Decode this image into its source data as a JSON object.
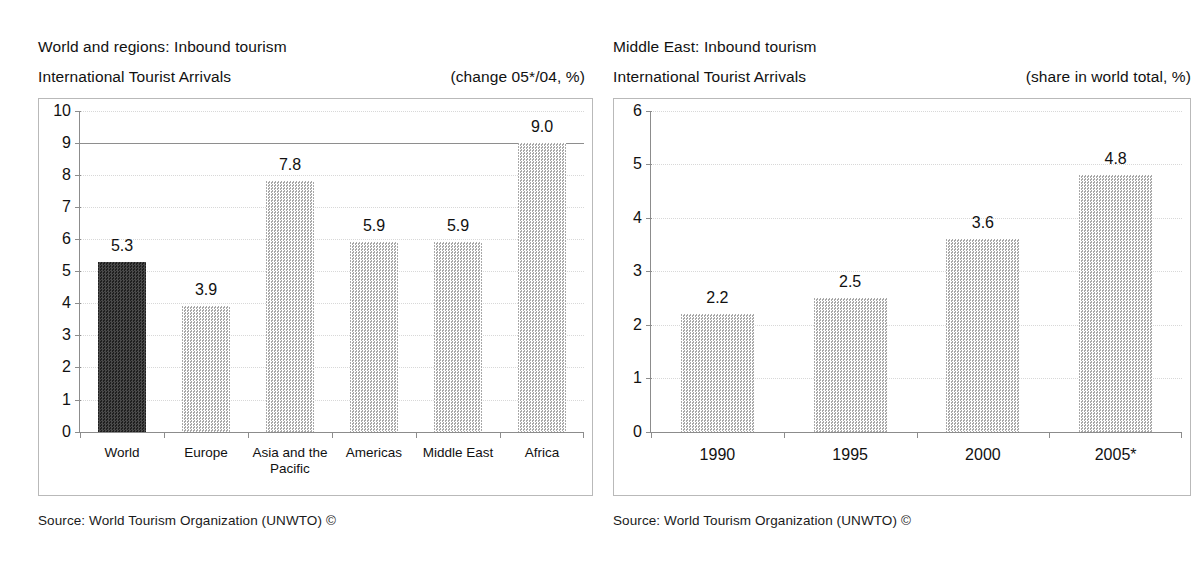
{
  "charts": [
    {
      "title": "World and regions: Inbound tourism",
      "subtitle": "International Tourist Arrivals",
      "note": "(change 05*/04, %)",
      "source": "Source: World Tourism Organization (UNWTO) ©"
    },
    {
      "title": "Middle East: Inbound tourism",
      "subtitle": "International Tourist Arrivals",
      "note": "(share in world total, %)",
      "source": "Source: World Tourism Organization (UNWTO) ©"
    }
  ],
  "chart_data": [
    {
      "type": "bar",
      "title": "World and regions: Inbound tourism — International Tourist Arrivals",
      "xlabel": "",
      "ylabel": "",
      "ylim": [
        0,
        10
      ],
      "yticks": [
        0,
        1,
        2,
        3,
        4,
        5,
        6,
        7,
        8,
        9,
        10
      ],
      "ytick_labels": [
        "0",
        "1",
        "2",
        "3",
        "4",
        "5",
        "6",
        "7",
        "8",
        "9",
        "10"
      ],
      "grid": true,
      "legend": "none",
      "units": "change 05*/04, %",
      "categories": [
        "World",
        "Europe",
        "Asia and the Pacific",
        "Americas",
        "Middle East",
        "Africa"
      ],
      "category_lines": [
        [
          "World"
        ],
        [
          "Europe"
        ],
        [
          "Asia and the",
          "Pacific"
        ],
        [
          "Americas"
        ],
        [
          "Middle East"
        ],
        [
          "Africa"
        ]
      ],
      "values": [
        5.3,
        3.9,
        7.8,
        5.9,
        5.9,
        9.0
      ],
      "value_labels": [
        "5.3",
        "3.9",
        "7.8",
        "5.9",
        "5.9",
        "9.0"
      ],
      "highlight_index": 0,
      "colors": {
        "bar": "#d7d7d7",
        "bar_highlight": "#4a4a4a",
        "grid": "#d8d8d8",
        "axis": "#8c8c8c",
        "frame": "#b9b9b9"
      }
    },
    {
      "type": "bar",
      "title": "Middle East: Inbound tourism — International Tourist Arrivals",
      "xlabel": "",
      "ylabel": "",
      "ylim": [
        0,
        6
      ],
      "yticks": [
        0,
        1,
        2,
        3,
        4,
        5,
        6
      ],
      "ytick_labels": [
        "0",
        "1",
        "2",
        "3",
        "4",
        "5",
        "6"
      ],
      "grid": true,
      "legend": "none",
      "units": "share in world total, %",
      "categories": [
        "1990",
        "1995",
        "2000",
        "2005*"
      ],
      "category_lines": [
        [
          "1990"
        ],
        [
          "1995"
        ],
        [
          "2000"
        ],
        [
          "2005*"
        ]
      ],
      "values": [
        2.2,
        2.5,
        3.6,
        4.8
      ],
      "value_labels": [
        "2.2",
        "2.5",
        "3.6",
        "4.8"
      ],
      "highlight_index": -1,
      "colors": {
        "bar": "#d7d7d7",
        "grid": "#d8d8d8",
        "axis": "#8c8c8c",
        "frame": "#b9b9b9"
      }
    }
  ]
}
